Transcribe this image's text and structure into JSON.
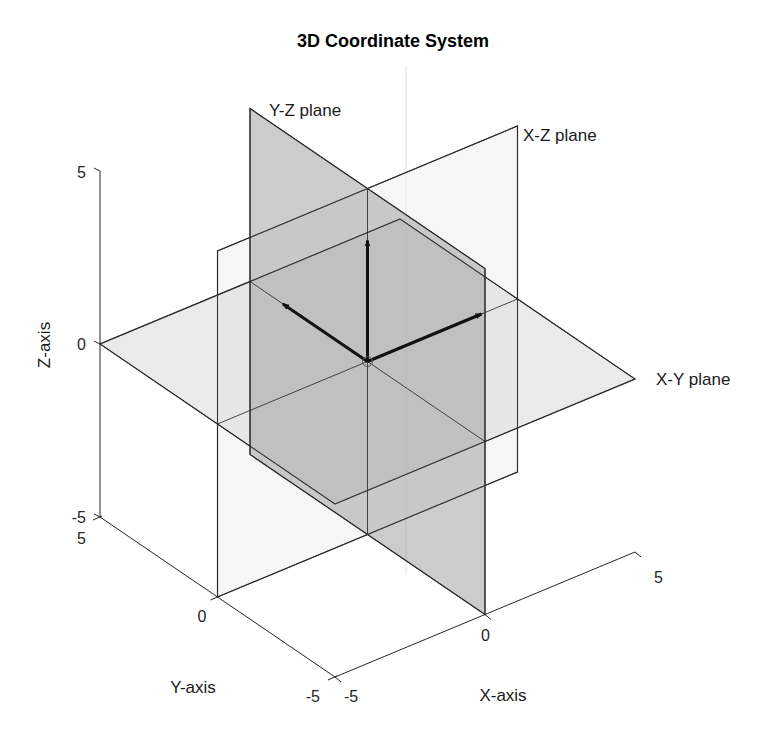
{
  "chart_data": {
    "type": "3d-planes",
    "title": "3D Coordinate System",
    "xlabel": "X-axis",
    "ylabel": "Y-axis",
    "zlabel": "Z-axis",
    "xlim": [
      -5,
      5
    ],
    "ylim": [
      -5,
      5
    ],
    "zlim": [
      -5,
      5
    ],
    "xticks": [
      -5,
      0,
      5
    ],
    "yticks": [
      -5,
      0,
      5
    ],
    "zticks": [
      -5,
      0,
      5
    ],
    "grid": false,
    "view": "isometric-like (MATLAB default view)",
    "planes": [
      {
        "name": "X-Y plane",
        "equation": "z = 0",
        "extent": {
          "x": [
            -5,
            5
          ],
          "y": [
            -5,
            5
          ]
        },
        "color": "#d9d9d9",
        "alpha": 0.55,
        "label_at": [
          5,
          -5,
          0
        ]
      },
      {
        "name": "Y-Z plane",
        "equation": "x = 0",
        "extent": {
          "y": [
            -5,
            5
          ],
          "z": [
            -5,
            5
          ]
        },
        "color": "#9a9a9a",
        "alpha": 0.5,
        "label_at": [
          0,
          5,
          5
        ]
      },
      {
        "name": "X-Z plane",
        "equation": "y = 0",
        "extent": {
          "x": [
            -5,
            5
          ],
          "z": [
            -5,
            5
          ]
        },
        "color": "#f2f2f2",
        "alpha": 0.35,
        "label_at": [
          5,
          0,
          5
        ]
      }
    ],
    "vectors": [
      {
        "name": "x-unit-vector",
        "from": [
          0,
          0,
          0
        ],
        "to": [
          3.8,
          0,
          0
        ]
      },
      {
        "name": "y-unit-vector",
        "from": [
          0,
          0,
          0
        ],
        "to": [
          0,
          3.6,
          0
        ]
      },
      {
        "name": "z-unit-vector",
        "from": [
          0,
          0,
          0
        ],
        "to": [
          0,
          0,
          3.5
        ]
      }
    ],
    "origin_marker": "circle"
  },
  "labels": {
    "title": "3D Coordinate System",
    "xlabel": "X-axis",
    "ylabel": "Y-axis",
    "zlabel": "Z-axis",
    "plane_xy": "X-Y plane",
    "plane_yz": "Y-Z plane",
    "plane_xz": "X-Z plane",
    "x_ticks": [
      "-5",
      "0",
      "5"
    ],
    "y_ticks": [
      "5",
      "0",
      "-5"
    ],
    "z_ticks": [
      "5",
      "0",
      "-5"
    ]
  },
  "colors": {
    "axis": "#262626",
    "vector": "#111111",
    "xy_fill": "#d9d9d9",
    "yz_fill": "#9a9a9a",
    "xz_fill": "#eeeeee"
  }
}
